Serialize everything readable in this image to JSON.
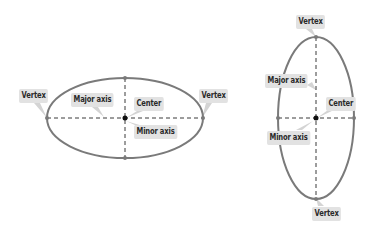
{
  "colors": {
    "ellipse_stroke": "#7a7a7a",
    "axis_stroke": "#3a3a3a",
    "center_dot": "#111111",
    "label_bg": "#e2e2e2",
    "label_text": "#2a2a2a",
    "pointer": "#cfcfcf"
  },
  "horizontal_ellipse": {
    "labels": {
      "vertex_left": "Vertex",
      "major_axis": "Major axis",
      "center": "Center",
      "vertex_right": "Vertex",
      "minor_axis": "Minor axis"
    }
  },
  "vertical_ellipse": {
    "labels": {
      "vertex_top": "Vertex",
      "major_axis": "Major axis",
      "center": "Center",
      "minor_axis": "Minor axis",
      "vertex_bottom": "Vertex"
    }
  }
}
